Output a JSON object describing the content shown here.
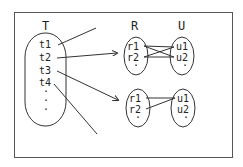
{
  "diagram": {
    "frame": {
      "x": 14,
      "y": 12,
      "w": 218,
      "h": 145
    },
    "colors": {
      "stroke": "#333333",
      "text": "#222222",
      "background": "#ffffff"
    },
    "sets": {
      "T": {
        "label": "T",
        "items": [
          "t1",
          "t2",
          "t3",
          "t4"
        ],
        "ellipsis": [
          "·",
          "·",
          "·"
        ]
      },
      "R": {
        "label": "R"
      },
      "U": {
        "label": "U"
      }
    },
    "relation_1": {
      "R_items": [
        "r1",
        "r2"
      ],
      "R_ellipsis": "·",
      "U_items": [
        "u1",
        "u2"
      ],
      "U_ellipsis": "·",
      "edges": [
        [
          "r1",
          "u1"
        ],
        [
          "r1",
          "u2"
        ],
        [
          "r2",
          "u1"
        ],
        [
          "r2",
          "u2"
        ]
      ]
    },
    "relation_2": {
      "R_items": [
        "r1",
        "r2"
      ],
      "R_ellipsis": "·",
      "U_items": [
        "u1",
        "u2"
      ],
      "U_ellipsis": "·",
      "edges": [
        [
          "r1",
          "u1"
        ],
        [
          "r2",
          "u1"
        ]
      ]
    },
    "mappings": [
      {
        "from": "t1",
        "to": "off-frame",
        "arrow": false
      },
      {
        "from": "t2",
        "to": "relation_1",
        "arrow": true
      },
      {
        "from": "t3",
        "to": "relation_2",
        "arrow": true
      },
      {
        "from": "t4",
        "to": "off-frame",
        "arrow": false
      }
    ]
  }
}
